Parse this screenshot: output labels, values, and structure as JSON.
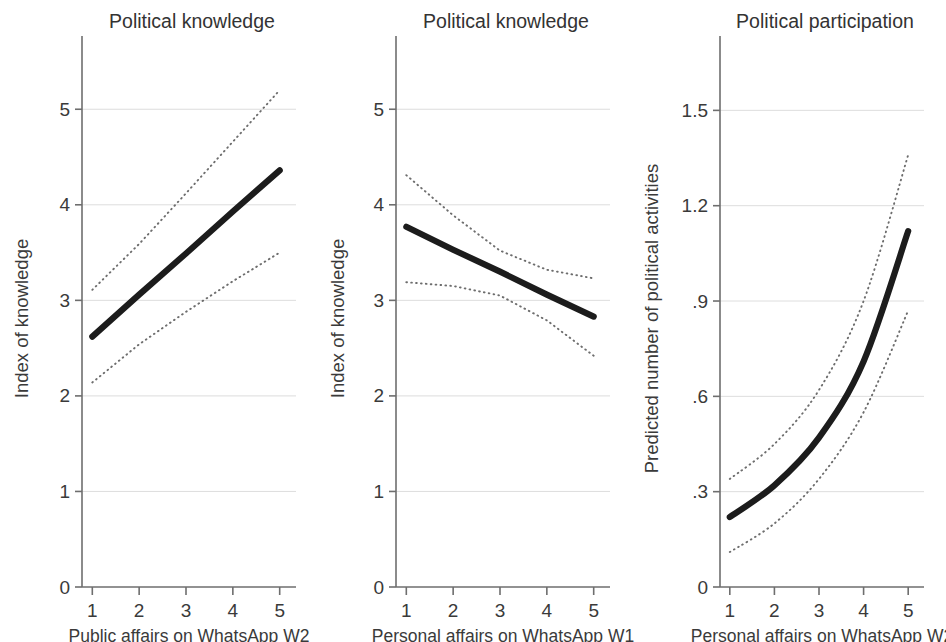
{
  "figure": {
    "width": 946,
    "height": 642,
    "background": "#ffffff",
    "line_color": "#1c1c1c",
    "ci_color": "#6d6d6d",
    "grid_color": "#d9d9d9",
    "axis_color": "#6e6e6e"
  },
  "chart_data": [
    {
      "type": "line",
      "title": "Political knowledge",
      "xlabel": "Public affairs on WhatsApp W2",
      "ylabel": "Index of knowledge",
      "x": [
        1,
        2,
        3,
        4,
        5
      ],
      "xlim": [
        0.78,
        5.22
      ],
      "ylim": [
        0,
        5.62
      ],
      "xticks": [
        1,
        2,
        3,
        4,
        5
      ],
      "xtick_labels": [
        "1",
        "2",
        "3",
        "4",
        "5"
      ],
      "yticks": [
        0,
        1,
        2,
        3,
        4,
        5
      ],
      "ytick_labels": [
        "0",
        "1",
        "2",
        "3",
        "4",
        "5"
      ],
      "grid": true,
      "series": [
        {
          "name": "Predicted index of knowledge",
          "style": "solid",
          "values": [
            2.62,
            3.06,
            3.49,
            3.93,
            4.36
          ]
        },
        {
          "name": "Upper 95% CI",
          "style": "dotted",
          "values": [
            3.11,
            3.59,
            4.12,
            4.66,
            5.2
          ]
        },
        {
          "name": "Lower 95% CI",
          "style": "dotted",
          "values": [
            2.14,
            2.54,
            2.88,
            3.2,
            3.5
          ]
        }
      ]
    },
    {
      "type": "line",
      "title": "Political knowledge",
      "xlabel": "Personal affairs on WhatsApp W1",
      "ylabel": "Index of knowledge",
      "x": [
        1,
        2,
        3,
        4,
        5
      ],
      "xlim": [
        0.78,
        5.22
      ],
      "ylim": [
        0,
        5.62
      ],
      "xticks": [
        1,
        2,
        3,
        4,
        5
      ],
      "xtick_labels": [
        "1",
        "2",
        "3",
        "4",
        "5"
      ],
      "yticks": [
        0,
        1,
        2,
        3,
        4,
        5
      ],
      "ytick_labels": [
        "0",
        "1",
        "2",
        "3",
        "4",
        "5"
      ],
      "grid": true,
      "series": [
        {
          "name": "Predicted index of knowledge",
          "style": "solid",
          "values": [
            3.77,
            3.53,
            3.3,
            3.06,
            2.83
          ]
        },
        {
          "name": "Upper 95% CI",
          "style": "dotted",
          "values": [
            4.31,
            3.89,
            3.52,
            3.32,
            3.23
          ]
        },
        {
          "name": "Lower 95% CI",
          "style": "dotted",
          "values": [
            3.19,
            3.15,
            3.05,
            2.79,
            2.42
          ]
        }
      ]
    },
    {
      "type": "line",
      "title": "Political participation",
      "xlabel": "Personal affairs on WhatsApp W2",
      "ylabel": "Predicted number of political activities",
      "x": [
        1,
        2,
        3,
        4,
        5
      ],
      "xlim": [
        0.78,
        5.22
      ],
      "ylim": [
        0,
        1.69
      ],
      "xticks": [
        1,
        2,
        3,
        4,
        5
      ],
      "xtick_labels": [
        "1",
        "2",
        "3",
        "4",
        "5"
      ],
      "yticks": [
        0,
        0.3,
        0.6,
        0.9,
        1.2,
        1.5
      ],
      "ytick_labels": [
        "0",
        ".3",
        ".6",
        ".9",
        "1.2",
        "1.5"
      ],
      "grid": true,
      "series": [
        {
          "name": "Predicted number of political activities",
          "style": "solid",
          "values": [
            0.22,
            0.32,
            0.47,
            0.71,
            1.12
          ]
        },
        {
          "name": "Upper 95% CI",
          "style": "dotted",
          "values": [
            0.34,
            0.45,
            0.62,
            0.9,
            1.36
          ]
        },
        {
          "name": "Lower 95% CI",
          "style": "dotted",
          "values": [
            0.11,
            0.2,
            0.34,
            0.55,
            0.87
          ]
        }
      ]
    }
  ],
  "caption": ""
}
